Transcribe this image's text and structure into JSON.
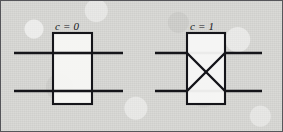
{
  "figure": {
    "background_color": "#d8d8d5",
    "ink_color": "#15151a",
    "border_color": "#56565a",
    "box_fill_color": "#f7f7f5",
    "caption": ""
  },
  "switches": [
    {
      "id": "switch-bar-state",
      "label": "c = 0",
      "state_value": "0",
      "state_name": "bar",
      "box": {
        "x": 53,
        "y": 33,
        "width": 39,
        "height": 71
      },
      "wires": [
        {
          "name": "upper-wire",
          "x1": 14,
          "y1": 53,
          "x2": 123,
          "y2": 53
        },
        {
          "name": "lower-wire",
          "x1": 14,
          "y1": 91,
          "x2": 123,
          "y2": 91
        }
      ],
      "diagonals": []
    },
    {
      "id": "switch-cross-state",
      "label": "c = 1",
      "state_value": "1",
      "state_name": "cross",
      "box": {
        "x": 187,
        "y": 33,
        "width": 38,
        "height": 71
      },
      "wires": [
        {
          "name": "upper-wire",
          "x1": 155,
          "y1": 53,
          "x2": 262,
          "y2": 53
        },
        {
          "name": "lower-wire",
          "x1": 155,
          "y1": 91,
          "x2": 262,
          "y2": 91
        }
      ],
      "diagonals": [
        {
          "name": "diagonal-down",
          "x1": 187,
          "y1": 53,
          "x2": 225,
          "y2": 91
        },
        {
          "name": "diagonal-up",
          "x1": 187,
          "y1": 91,
          "x2": 225,
          "y2": 53
        }
      ]
    }
  ]
}
